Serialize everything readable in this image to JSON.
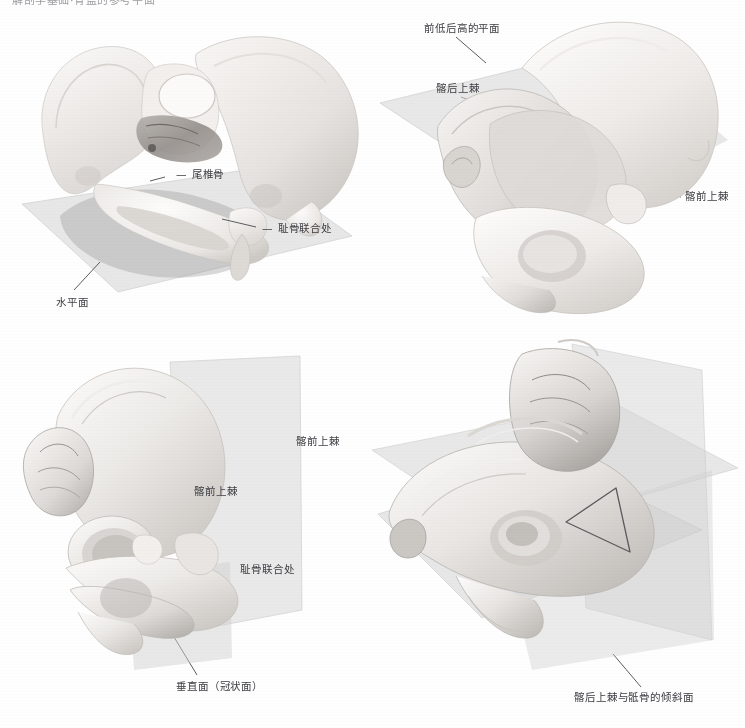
{
  "page": {
    "running_head": "解剖学基础·骨盆的参考平面",
    "background": "#fefefe"
  },
  "colors": {
    "bone_light": "#f3f1ef",
    "bone_mid": "#e2dfdc",
    "bone_shadow": "#b9b5b2",
    "bone_deep": "#8e8a87",
    "plane_fill": "#d9d9d9",
    "plane_fill_dark": "#c4c4c4",
    "plane_stroke": "#bdbdbd",
    "label_text": "#3c3c42",
    "leader_line": "#4a4a50",
    "triangle_stroke": "#5a5a5e"
  },
  "figures": [
    {
      "id": "panel-tl",
      "name": "pelvis-horizontal-plane",
      "view": "anterior-superior oblique",
      "plane_count": 1,
      "labels": [
        {
          "key": "coccyx",
          "text": "尾椎骨",
          "x": 176,
          "y": 168,
          "dash": true
        },
        {
          "key": "pubic_symphysis",
          "text": "耻骨联合处",
          "x": 261,
          "y": 222,
          "dash": true
        },
        {
          "key": "horizontal_plane",
          "text": "水平面",
          "x": 58,
          "y": 298,
          "dash": false
        }
      ]
    },
    {
      "id": "panel-tr",
      "name": "pelvis-inclined-plane",
      "view": "posterior oblique",
      "plane_count": 1,
      "labels": [
        {
          "key": "low_front_high_back_plane",
          "text": "前低后高的平面",
          "x": 425,
          "y": 25,
          "dash": false
        },
        {
          "key": "psis",
          "text": "髂后上棘",
          "x": 437,
          "y": 85,
          "dash": false
        },
        {
          "key": "asis",
          "text": "髂前上棘",
          "x": 685,
          "y": 193,
          "dash": false
        }
      ]
    },
    {
      "id": "panel-bl",
      "name": "pelvis-vertical-coronal-plane",
      "view": "left lateral oblique",
      "plane_count": 1,
      "labels": [
        {
          "key": "asis_upper",
          "text": "髂前上棘",
          "x": 296,
          "y": 438,
          "dash": false
        },
        {
          "key": "asis_lower",
          "text": "髂前上棘",
          "x": 195,
          "y": 487,
          "dash": false
        },
        {
          "key": "pubic_symphysis",
          "text": "耻骨联合处",
          "x": 241,
          "y": 566,
          "dash": false
        },
        {
          "key": "vertical_plane",
          "text": "垂直面（冠状面）",
          "x": 178,
          "y": 683,
          "dash": false
        }
      ]
    },
    {
      "id": "panel-br",
      "name": "pelvis-combined-planes",
      "view": "superior oblique",
      "plane_count": 3,
      "has_triangle_overlay": true,
      "labels": [
        {
          "key": "psis_sacrum_inclined_plane",
          "text": "髂后上棘与骶骨的倾斜面",
          "x": 576,
          "y": 694,
          "dash": false
        }
      ]
    }
  ],
  "leaders": [
    {
      "key": "tl-coccyx",
      "x1": 165,
      "y1": 177,
      "x2": 152,
      "y2": 182
    },
    {
      "key": "tl-pubic",
      "x1": 256,
      "y1": 227,
      "x2": 223,
      "y2": 220
    },
    {
      "key": "tl-horizontal",
      "x1": 74,
      "y1": 290,
      "x2": 99,
      "y2": 263
    },
    {
      "key": "tr-plane",
      "x1": 455,
      "y1": 36,
      "x2": 485,
      "y2": 62
    },
    {
      "key": "tr-psis",
      "x1": 460,
      "y1": 96,
      "x2": 497,
      "y2": 110
    },
    {
      "key": "tr-asis",
      "x1": 681,
      "y1": 196,
      "x2": 637,
      "y2": 184
    },
    {
      "key": "bl-vertical",
      "x1": 196,
      "y1": 675,
      "x2": 173,
      "y2": 637
    },
    {
      "key": "br-inclined",
      "x1": 640,
      "y1": 686,
      "x2": 613,
      "y2": 655
    }
  ]
}
